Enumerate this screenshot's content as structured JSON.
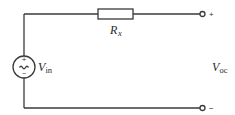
{
  "diagram": {
    "type": "circuit-schematic",
    "components": {
      "source": {
        "kind": "ac-voltage-source",
        "label_main": "V",
        "label_sub": "in",
        "polarity_top": "+",
        "polarity_bottom": "−",
        "symbol": "~"
      },
      "resistor": {
        "kind": "resistor",
        "label_main": "R",
        "label_sub": "x"
      }
    },
    "terminals": {
      "positive": "+",
      "negative": "−"
    },
    "output": {
      "label_main": "V",
      "label_sub": "oc"
    },
    "colors": {
      "line": "#3a3a3a",
      "text": "#2a2a2a",
      "background": "#ffffff"
    }
  }
}
